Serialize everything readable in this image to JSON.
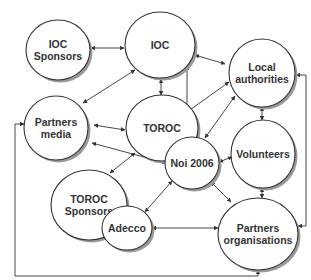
{
  "diagram": {
    "colors": {
      "stroke": "#333333",
      "fill": "#ffffff",
      "shadow": "#9a9a9a",
      "text": "#333333"
    },
    "nodes": [
      {
        "id": "ioc_sponsors",
        "lines": [
          "IOC",
          "Sponsors"
        ],
        "cx": 58,
        "cy": 50,
        "rx": 32,
        "ry": 30
      },
      {
        "id": "ioc",
        "lines": [
          "IOC"
        ],
        "cx": 160,
        "cy": 45,
        "rx": 35,
        "ry": 33
      },
      {
        "id": "local_authorities",
        "lines": [
          "Local",
          "authorities"
        ],
        "cx": 262,
        "cy": 73,
        "rx": 33,
        "ry": 34
      },
      {
        "id": "partners_media",
        "lines": [
          "Partners",
          "media"
        ],
        "cx": 56,
        "cy": 128,
        "rx": 32,
        "ry": 32
      },
      {
        "id": "toroc",
        "lines": [
          "TOROC"
        ],
        "cx": 162,
        "cy": 128,
        "rx": 36,
        "ry": 33
      },
      {
        "id": "volunteers",
        "lines": [
          "Volunteers"
        ],
        "cx": 263,
        "cy": 154,
        "rx": 32,
        "ry": 34
      },
      {
        "id": "toroc_sponsors",
        "lines": [
          "TOROC",
          "Sponsors"
        ],
        "cx": 89,
        "cy": 205,
        "rx": 38,
        "ry": 35
      },
      {
        "id": "adecco",
        "lines": [
          "Adecco"
        ],
        "cx": 127,
        "cy": 228,
        "rx": 25,
        "ry": 22
      },
      {
        "id": "noi2006",
        "lines": [
          "Noi 2006"
        ],
        "cx": 192,
        "cy": 163,
        "rx": 27,
        "ry": 26
      },
      {
        "id": "partners_organisations",
        "lines": [
          "Partners",
          "organisations"
        ],
        "cx": 258,
        "cy": 234,
        "rx": 40,
        "ry": 36
      }
    ],
    "edges": [
      {
        "from": "ioc_sponsors",
        "to": "ioc",
        "points": [
          [
            91,
            48
          ],
          [
            124,
            48
          ]
        ],
        "arrows": "both"
      },
      {
        "from": "ioc",
        "to": "partners_media",
        "points": [
          [
            135,
            70
          ],
          [
            83,
            103
          ]
        ],
        "arrows": "both"
      },
      {
        "from": "ioc",
        "to": "toroc",
        "points": [
          [
            161,
            79
          ],
          [
            161,
            95
          ]
        ],
        "arrows": "both"
      },
      {
        "from": "ioc",
        "to": "local_authorities",
        "points": [
          [
            195,
            55
          ],
          [
            225,
            64
          ]
        ],
        "arrows": "both"
      },
      {
        "from": "ioc",
        "to": "noi2006",
        "points": [
          [
            187,
            66
          ],
          [
            187,
            137
          ]
        ],
        "arrows": "both"
      },
      {
        "from": "partners_media",
        "to": "toroc",
        "points": [
          [
            94,
            125
          ],
          [
            125,
            130
          ]
        ],
        "arrows": "both"
      },
      {
        "from": "partners_media",
        "to": "noi2006",
        "points": [
          [
            92,
            143
          ],
          [
            166,
            163
          ]
        ],
        "arrows": "both"
      },
      {
        "from": "toroc",
        "to": "local_authorities",
        "points": [
          [
            187,
            112
          ],
          [
            229,
            82
          ]
        ],
        "arrows": "both"
      },
      {
        "from": "toroc",
        "to": "toroc_sponsors",
        "points": [
          [
            135,
            153
          ],
          [
            110,
            173
          ]
        ],
        "arrows": "both"
      },
      {
        "from": "local_authorities",
        "to": "volunteers",
        "points": [
          [
            262,
            107
          ],
          [
            262,
            120
          ]
        ],
        "arrows": "both"
      },
      {
        "from": "local_authorities",
        "to": "noi2006",
        "points": [
          [
            235,
            96
          ],
          [
            205,
            138
          ]
        ],
        "arrows": "both"
      },
      {
        "from": "volunteers",
        "to": "noi2006",
        "points": [
          [
            232,
            157
          ],
          [
            219,
            162
          ]
        ],
        "arrows": "both"
      },
      {
        "from": "volunteers",
        "to": "partners_organisations",
        "points": [
          [
            262,
            188
          ],
          [
            262,
            198
          ]
        ],
        "arrows": "both"
      },
      {
        "from": "noi2006",
        "to": "adecco",
        "points": [
          [
            172,
            181
          ],
          [
            145,
            212
          ]
        ],
        "arrows": "both"
      },
      {
        "from": "noi2006",
        "to": "partners_organisations",
        "points": [
          [
            211,
            182
          ],
          [
            231,
            202
          ]
        ],
        "arrows": "both"
      },
      {
        "from": "adecco",
        "to": "partners_organisations",
        "points": [
          [
            152,
            228
          ],
          [
            218,
            228
          ]
        ],
        "arrows": "both"
      },
      {
        "from": "partners_organisations",
        "to": "local_authorities",
        "points": [
          [
            298,
            226
          ],
          [
            306,
            226
          ],
          [
            306,
            75
          ],
          [
            296,
            75
          ]
        ],
        "arrows": "both"
      },
      {
        "from": "partners_organisations",
        "to": "partners_media",
        "points": [
          [
            258,
            270
          ],
          [
            258,
            276
          ],
          [
            15,
            276
          ],
          [
            15,
            124
          ],
          [
            24,
            124
          ]
        ],
        "arrows": "both"
      }
    ]
  }
}
